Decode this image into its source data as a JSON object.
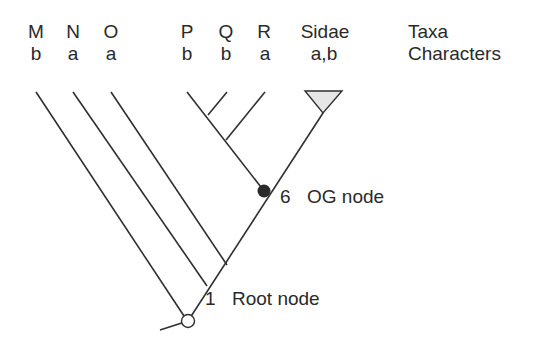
{
  "taxa": [
    {
      "name": "M",
      "character": "b"
    },
    {
      "name": "N",
      "character": "a"
    },
    {
      "name": "O",
      "character": "a"
    },
    {
      "name": "P",
      "character": "b"
    },
    {
      "name": "Q",
      "character": "b"
    },
    {
      "name": "R",
      "character": "a"
    },
    {
      "name": "Sidae",
      "character": "a,b"
    }
  ],
  "legend": {
    "taxa_label": "Taxa",
    "characters_label": "Characters"
  },
  "nodes": {
    "og": {
      "number": "6",
      "label": "OG node",
      "fill": "#2a2a2a"
    },
    "root": {
      "number": "1",
      "label": "Root node",
      "fill": "#ffffff"
    }
  },
  "colors": {
    "line": "#2f2f2f",
    "clade_triangle_fill": "#e6e6e6"
  }
}
